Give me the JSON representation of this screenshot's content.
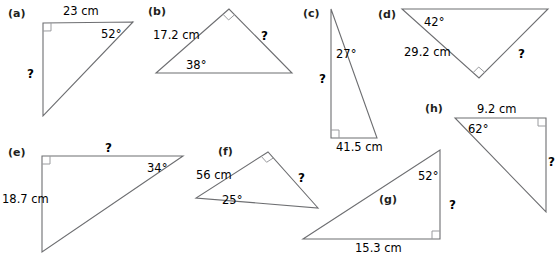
{
  "page": {
    "background_color": "#ffffff",
    "stroke_color": "#6d6e71",
    "text_color": "#000000",
    "unknown_symbol": "?",
    "width": 556,
    "height": 256
  },
  "figures": [
    {
      "tag": "(a)",
      "tag_pos": [
        8,
        8
      ],
      "vertices": {
        "top_left": [
          43,
          23
        ],
        "top_right": [
          133,
          22
        ],
        "bottom_left": [
          43,
          116
        ]
      },
      "right_angle_at": "top_left",
      "labels": [
        {
          "name": "side-top",
          "kind": "meas",
          "text": "23 cm",
          "x": 63,
          "y": 6
        },
        {
          "name": "angle-top-right",
          "kind": "ang",
          "text": "52°",
          "x": 101,
          "y": 29
        },
        {
          "name": "unknown-left-side",
          "kind": "unk",
          "text": "?",
          "x": 27,
          "y": 68
        }
      ]
    },
    {
      "tag": "(b)",
      "tag_pos": [
        148,
        6
      ],
      "vertices": {
        "apex": [
          229,
          9
        ],
        "left": [
          156,
          73
        ],
        "right": [
          292,
          73
        ]
      },
      "right_angle_at": "apex",
      "labels": [
        {
          "name": "side-upper-left",
          "kind": "meas",
          "text": "17.2 cm",
          "x": 153,
          "y": 30
        },
        {
          "name": "angle-left",
          "kind": "ang",
          "text": "38°",
          "x": 186,
          "y": 60
        },
        {
          "name": "unknown-upper-right-side",
          "kind": "unk",
          "text": "?",
          "x": 261,
          "y": 30
        }
      ]
    },
    {
      "tag": "(c)",
      "tag_pos": [
        303,
        8
      ],
      "vertices": {
        "top": [
          331,
          9
        ],
        "bottom_left": [
          331,
          138
        ],
        "bottom_right": [
          377,
          138
        ]
      },
      "right_angle_at": "bottom_left",
      "labels": [
        {
          "name": "angle-top",
          "kind": "ang",
          "text": "27°",
          "x": 336,
          "y": 49
        },
        {
          "name": "unknown-left-side",
          "kind": "unk",
          "text": "?",
          "x": 319,
          "y": 73
        },
        {
          "name": "side-bottom",
          "kind": "meas",
          "text": "41.5 cm",
          "x": 336,
          "y": 142
        }
      ]
    },
    {
      "tag": "(d)",
      "tag_pos": [
        378,
        9
      ],
      "vertices": {
        "top_left": [
          402,
          9
        ],
        "top_right": [
          548,
          9
        ],
        "bottom": [
          479,
          78
        ]
      },
      "right_angle_at": "bottom",
      "labels": [
        {
          "name": "angle-top-left",
          "kind": "ang",
          "text": "42°",
          "x": 424,
          "y": 17
        },
        {
          "name": "side-left",
          "kind": "meas",
          "text": "29.2 cm",
          "x": 404,
          "y": 47
        },
        {
          "name": "unknown-right-side",
          "kind": "unk",
          "text": "?",
          "x": 518,
          "y": 48
        }
      ]
    },
    {
      "tag": "(e)",
      "tag_pos": [
        8,
        147
      ],
      "vertices": {
        "top_left": [
          42,
          156
        ],
        "top_right": [
          183,
          156
        ],
        "bottom_left": [
          42,
          252
        ]
      },
      "right_angle_at": "top_left",
      "labels": [
        {
          "name": "unknown-top-side",
          "kind": "unk",
          "text": "?",
          "x": 105,
          "y": 142
        },
        {
          "name": "angle-top-right",
          "kind": "ang",
          "text": "34°",
          "x": 147,
          "y": 163
        },
        {
          "name": "side-left",
          "kind": "meas",
          "text": "18.7 cm",
          "x": 2,
          "y": 194
        }
      ]
    },
    {
      "tag": "(f)",
      "tag_pos": [
        218,
        146
      ],
      "vertices": {
        "apex": [
          268,
          152
        ],
        "left": [
          196,
          198
        ],
        "right": [
          318,
          208
        ]
      },
      "right_angle_at": "apex",
      "labels": [
        {
          "name": "side-upper-left",
          "kind": "meas",
          "text": "56 cm",
          "x": 196,
          "y": 170
        },
        {
          "name": "angle-left",
          "kind": "ang",
          "text": "25°",
          "x": 222,
          "y": 195
        },
        {
          "name": "unknown-right-side",
          "kind": "unk",
          "text": "?",
          "x": 298,
          "y": 172
        }
      ]
    },
    {
      "tag": "(g)",
      "tag_pos": [
        379,
        194
      ],
      "vertices": {
        "bottom_left": [
          303,
          239
        ],
        "bottom_right": [
          440,
          239
        ],
        "top_right": [
          440,
          150
        ]
      },
      "right_angle_at": "bottom_right",
      "labels": [
        {
          "name": "angle-top-right",
          "kind": "ang",
          "text": "52°",
          "x": 418,
          "y": 171
        },
        {
          "name": "unknown-right-side",
          "kind": "unk",
          "text": "?",
          "x": 449,
          "y": 199
        },
        {
          "name": "side-bottom",
          "kind": "meas",
          "text": "15.3 cm",
          "x": 355,
          "y": 243
        }
      ]
    },
    {
      "tag": "(h)",
      "tag_pos": [
        425,
        103
      ],
      "vertices": {
        "top_left": [
          455,
          118
        ],
        "top_right": [
          546,
          118
        ],
        "bottom_right": [
          546,
          212
        ]
      },
      "right_angle_at": "top_right",
      "labels": [
        {
          "name": "side-top",
          "kind": "meas",
          "text": "9.2 cm",
          "x": 477,
          "y": 104
        },
        {
          "name": "angle-top-left",
          "kind": "ang",
          "text": "62°",
          "x": 468,
          "y": 124
        },
        {
          "name": "unknown-right-side",
          "kind": "unk",
          "text": "?",
          "x": 548,
          "y": 156
        }
      ]
    }
  ]
}
